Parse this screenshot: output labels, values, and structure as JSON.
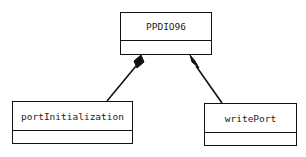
{
  "diagram": {
    "type": "uml-class-composition",
    "classes": [
      {
        "id": "ppdio96",
        "name": "PPDIO96"
      },
      {
        "id": "portInitialization",
        "name": "portInitialization"
      },
      {
        "id": "writePort",
        "name": "writePort"
      }
    ],
    "relations": [
      {
        "from": "PPDIO96",
        "to": "portInitialization",
        "kind": "composition"
      },
      {
        "from": "PPDIO96",
        "to": "writePort",
        "kind": "composition"
      }
    ]
  }
}
